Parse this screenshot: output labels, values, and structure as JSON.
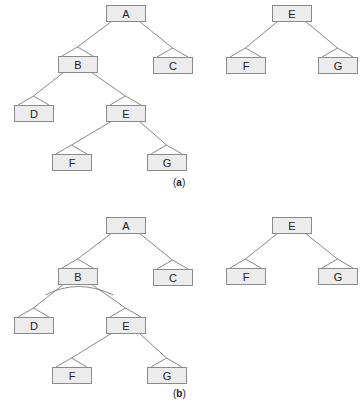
{
  "panels": [
    {
      "id": "a",
      "caption_open": "(",
      "caption_letter": "a",
      "caption_close": ")",
      "trees": [
        {
          "name": "main-tree",
          "nodes": [
            {
              "id": "A",
              "label": "A"
            },
            {
              "id": "B",
              "label": "B"
            },
            {
              "id": "C",
              "label": "C"
            },
            {
              "id": "D",
              "label": "D"
            },
            {
              "id": "E",
              "label": "E"
            },
            {
              "id": "F",
              "label": "F"
            },
            {
              "id": "G",
              "label": "G"
            }
          ],
          "edges": [
            [
              "A",
              "B"
            ],
            [
              "A",
              "C"
            ],
            [
              "B",
              "D"
            ],
            [
              "B",
              "E"
            ],
            [
              "E",
              "F"
            ],
            [
              "E",
              "G"
            ]
          ],
          "arcs": []
        },
        {
          "name": "subtree",
          "nodes": [
            {
              "id": "E",
              "label": "E"
            },
            {
              "id": "F",
              "label": "F"
            },
            {
              "id": "G",
              "label": "G"
            }
          ],
          "edges": [
            [
              "E",
              "F"
            ],
            [
              "E",
              "G"
            ]
          ],
          "arcs": []
        }
      ]
    },
    {
      "id": "b",
      "caption_open": "(",
      "caption_letter": "b",
      "caption_close": ")",
      "trees": [
        {
          "name": "main-tree",
          "nodes": [
            {
              "id": "A",
              "label": "A"
            },
            {
              "id": "B",
              "label": "B"
            },
            {
              "id": "C",
              "label": "C"
            },
            {
              "id": "D",
              "label": "D"
            },
            {
              "id": "E",
              "label": "E"
            },
            {
              "id": "F",
              "label": "F"
            },
            {
              "id": "G",
              "label": "G"
            }
          ],
          "edges": [
            [
              "A",
              "B"
            ],
            [
              "A",
              "C"
            ],
            [
              "B",
              "D"
            ],
            [
              "B",
              "E"
            ],
            [
              "E",
              "F"
            ],
            [
              "E",
              "G"
            ]
          ],
          "arcs": [
            [
              "B",
              "D",
              "E"
            ]
          ]
        },
        {
          "name": "subtree",
          "nodes": [
            {
              "id": "E",
              "label": "E"
            },
            {
              "id": "F",
              "label": "F"
            },
            {
              "id": "G",
              "label": "G"
            }
          ],
          "edges": [
            [
              "E",
              "F"
            ],
            [
              "E",
              "G"
            ]
          ],
          "arcs": []
        }
      ]
    }
  ]
}
